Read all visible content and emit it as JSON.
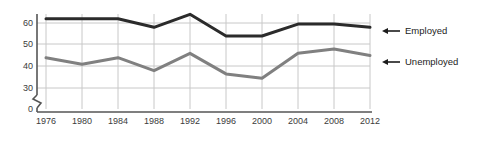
{
  "chart_data": {
    "type": "line",
    "title": "",
    "subtitle": "",
    "xlabel": "",
    "ylabel": "",
    "categories": [
      "1976",
      "1980",
      "1984",
      "1988",
      "1992",
      "1996",
      "2000",
      "2004",
      "2008",
      "2012"
    ],
    "x": [
      1976,
      1980,
      1984,
      1988,
      1992,
      1996,
      2000,
      2004,
      2008,
      2012
    ],
    "series": [
      {
        "name": "Employed",
        "color": "#2b2b2b",
        "values": [
          62,
          62,
          62,
          58,
          64,
          54,
          54,
          59.5,
          59.5,
          58
        ]
      },
      {
        "name": "Unemployed",
        "color": "#808080",
        "values": [
          44,
          41,
          44,
          38,
          46,
          36.5,
          34.5,
          46,
          48,
          45
        ]
      }
    ],
    "yticks": [
      0,
      30,
      40,
      50,
      60
    ],
    "ytick_labels": [
      "0",
      "30",
      "40",
      "50",
      "60"
    ],
    "ylim": [
      30,
      65
    ],
    "axis_break": true,
    "grid": true,
    "grid_color": "#c8c8c8",
    "axis_color": "#555555",
    "legend_position": "right",
    "legend": [
      {
        "label": "Employed",
        "arrow": "left-arrow"
      },
      {
        "label": "Unemployed",
        "arrow": "left-arrow"
      }
    ]
  },
  "axis": {
    "y_labels": [
      "60",
      "50",
      "40",
      "30",
      "0"
    ],
    "x_labels": [
      "1976",
      "1980",
      "1984",
      "1988",
      "1992",
      "1996",
      "2000",
      "2004",
      "2008",
      "2012"
    ]
  },
  "legend": {
    "employed_label": "Employed",
    "unemployed_label": "Unemployed"
  }
}
